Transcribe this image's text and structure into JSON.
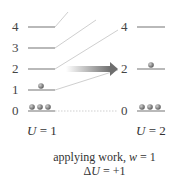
{
  "diagram": {
    "left_state": {
      "levels": [
        "0",
        "1",
        "2",
        "3",
        "4"
      ],
      "occupancy": {
        "0": 3,
        "1": 1,
        "2": 0,
        "3": 0,
        "4": 0
      },
      "energy_label": "U = 1",
      "energy_var": "U",
      "energy_value": "= 1"
    },
    "right_state": {
      "levels": [
        "0",
        "2",
        "4"
      ],
      "occupancy": {
        "0": 3,
        "2": 1,
        "4": 0
      },
      "energy_label": "U = 2",
      "energy_var": "U",
      "energy_value": "= 2"
    },
    "process_label": "applying work, w = 1",
    "process_prefix": "applying work, ",
    "process_var": "w",
    "process_value": " = 1",
    "delta_label": "ΔU = +1",
    "delta_prefix": "Δ",
    "delta_var": "U",
    "delta_value": " = +1",
    "colors": {
      "level_line": "#8a8a8a",
      "connector": "#cccccc",
      "particle": "#7a7a7a",
      "arrow_start": "#ffffff",
      "arrow_end": "#6e6e6e"
    }
  }
}
